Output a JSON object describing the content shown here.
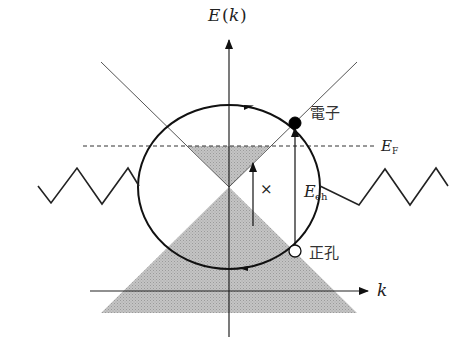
{
  "figure": {
    "axes": {
      "y_axis_label_E": "E",
      "y_axis_label_paren_open": "(",
      "y_axis_label_k": "k",
      "y_axis_label_paren_close": ")",
      "x_axis_label": "k"
    },
    "fermi_level": {
      "label_main": "E",
      "label_sub": "F",
      "style": "dashed"
    },
    "excitation": {
      "label_main": "E",
      "label_sub": "eh"
    },
    "forbidden_transition_mark": "×",
    "particles": {
      "electron_label": "電子",
      "electron_color": "#000000",
      "hole_label": "正孔",
      "hole_color": "#ffffff"
    },
    "colors": {
      "line": "#222222",
      "fill_shade": "#b8b8b8",
      "cone_line": "#555555",
      "background": "#ffffff"
    }
  }
}
